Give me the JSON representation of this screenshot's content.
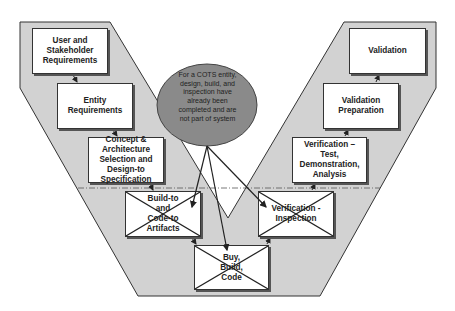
{
  "diagram": {
    "type": "V-model",
    "colors": {
      "background": "#ffffff",
      "v_fill": "#d2d2d2",
      "outline": "#333333",
      "ellipse_fill": "#8a8a8a",
      "box_fill": "#ffffff"
    },
    "left_arm": [
      {
        "id": "user-stakeholder-req",
        "label": "User and\nStakeholder\nRequirements"
      },
      {
        "id": "entity-req",
        "label": "Entity\nRequirements"
      },
      {
        "id": "concept-arch",
        "label": "Concept &\nArchitecture\nSelection and\nDesign-to\nSpecification"
      },
      {
        "id": "build-to",
        "label": "Build-to\nand\nCode-to\nArtifacts",
        "crossed_out": true
      }
    ],
    "bottom": {
      "id": "buy-build-code",
      "label": "Buy,\nBuild,\nCode",
      "crossed_out": true
    },
    "right_arm": [
      {
        "id": "verification-inspection",
        "label": "Verification -\nInspection",
        "crossed_out": true
      },
      {
        "id": "verification-test",
        "label": "Verification – Test,\nDemonstration,\nAnalysis"
      },
      {
        "id": "validation-prep",
        "label": "Validation\nPreparation"
      },
      {
        "id": "validation",
        "label": "Validation"
      }
    ],
    "callout": {
      "text": "For a COTS entity,\ndesign, build, and\ninspection have\nalready been\ncompleted and are\nnot part of system",
      "points_to": [
        "build-to",
        "buy-build-code",
        "verification-inspection"
      ]
    },
    "divider": "dash-dot horizontal line"
  }
}
